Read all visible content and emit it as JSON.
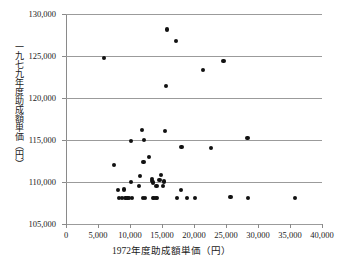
{
  "chart_data": {
    "type": "scatter",
    "title": "",
    "xlabel": "1972年度助成額単価（円）",
    "ylabel": "一九七九年度助成額単価（円）",
    "xlim": [
      0,
      40000
    ],
    "ylim": [
      105000,
      130000
    ],
    "xticks": [
      0,
      5000,
      10000,
      15000,
      20000,
      25000,
      30000,
      35000,
      40000
    ],
    "xtick_labels": [
      "0",
      "5,000",
      "10,000",
      "15,000",
      "20,000",
      "25,000",
      "30,000",
      "35,000",
      "40,000"
    ],
    "yticks": [
      105000,
      110000,
      115000,
      120000,
      125000,
      130000
    ],
    "ytick_labels": [
      "105,000",
      "110,000",
      "115,000",
      "120,000",
      "125,000",
      "130,000"
    ],
    "grid": "horizontal",
    "legend": "none",
    "marker": "filled-circle",
    "marker_color": "#111111",
    "points": [
      [
        5900,
        124800
      ],
      [
        7450,
        112000
      ],
      [
        8150,
        109000
      ],
      [
        8300,
        108100
      ],
      [
        8750,
        108100
      ],
      [
        9100,
        109100
      ],
      [
        9300,
        108100
      ],
      [
        9600,
        108100
      ],
      [
        9900,
        108100
      ],
      [
        10150,
        110000
      ],
      [
        10200,
        114900
      ],
      [
        10350,
        108100
      ],
      [
        11400,
        109500
      ],
      [
        11550,
        110700
      ],
      [
        11900,
        116150
      ],
      [
        12000,
        108100
      ],
      [
        12100,
        112400
      ],
      [
        12200,
        115000
      ],
      [
        12350,
        108100
      ],
      [
        13000,
        112950
      ],
      [
        13400,
        110150
      ],
      [
        13500,
        110350
      ],
      [
        13550,
        109950
      ],
      [
        13600,
        108100
      ],
      [
        13800,
        108100
      ],
      [
        14000,
        108100
      ],
      [
        14150,
        109550
      ],
      [
        14250,
        108100
      ],
      [
        14600,
        110250
      ],
      [
        14900,
        110800
      ],
      [
        15150,
        109500
      ],
      [
        15350,
        110050
      ],
      [
        15500,
        116100
      ],
      [
        15600,
        121450
      ],
      [
        15750,
        128150
      ],
      [
        17150,
        126800
      ],
      [
        17300,
        108100
      ],
      [
        17950,
        109000
      ],
      [
        18050,
        114200
      ],
      [
        18850,
        108100
      ],
      [
        20150,
        108100
      ],
      [
        21400,
        123300
      ],
      [
        22650,
        114000
      ],
      [
        24600,
        124400
      ],
      [
        25700,
        108200
      ],
      [
        28350,
        115200
      ],
      [
        28400,
        108100
      ],
      [
        35800,
        108050
      ]
    ]
  }
}
